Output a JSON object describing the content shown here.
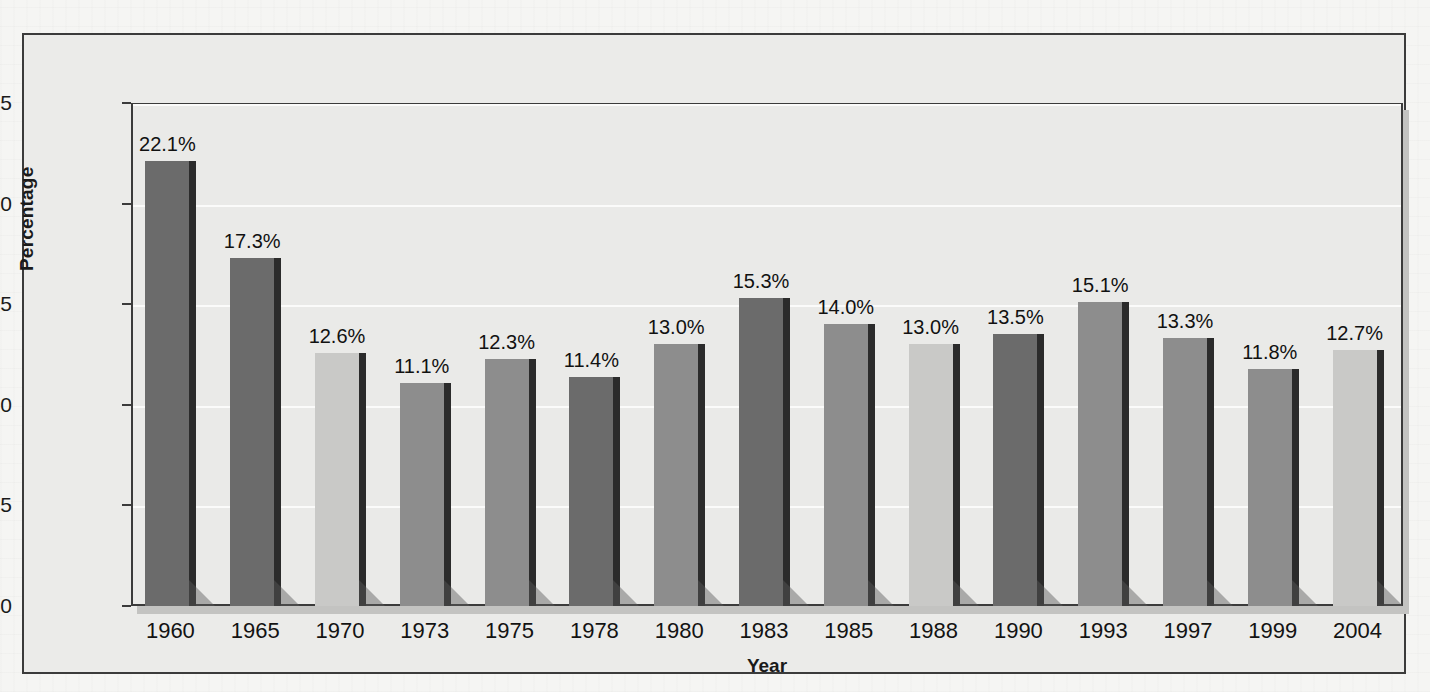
{
  "chart_data": {
    "type": "bar",
    "title": "",
    "xlabel": "Year",
    "ylabel": "Percentage",
    "categories": [
      "1960",
      "1965",
      "1970",
      "1973",
      "1975",
      "1978",
      "1980",
      "1983",
      "1985",
      "1988",
      "1990",
      "1993",
      "1997",
      "1999",
      "2004"
    ],
    "values": [
      22.1,
      17.3,
      12.6,
      11.1,
      12.3,
      11.4,
      13.0,
      15.3,
      14.0,
      13.0,
      13.5,
      15.1,
      13.3,
      11.8,
      12.7
    ],
    "data_labels": [
      "22.1%",
      "17.3%",
      "12.6%",
      "11.1%",
      "12.3%",
      "11.4%",
      "13.0%",
      "15.3%",
      "14.0%",
      "13.0%",
      "13.5%",
      "15.1%",
      "13.3%",
      "11.8%",
      "12.7%"
    ],
    "bar_shades": [
      "dark",
      "dark",
      "light",
      "medium",
      "medium",
      "dark",
      "medium",
      "dark",
      "medium",
      "light",
      "dark",
      "medium",
      "medium",
      "medium",
      "light"
    ],
    "ylim": [
      0,
      25
    ],
    "yticks": [
      0,
      5,
      10,
      15,
      20,
      25
    ],
    "ytick_labels": [
      "0",
      "5",
      "10",
      "15",
      "20",
      "25"
    ],
    "grid": true,
    "legend": "none"
  },
  "colors": {
    "bar_dark": "#6b6b6b",
    "bar_medium": "#8d8d8d",
    "bar_light": "#c9c9c7",
    "bar_edge": "#2b2b2b",
    "plot_background": "#eaeae8",
    "page_background": "#f5f5f3",
    "frame_border": "#3b3b3b",
    "gridline": "#fbfbfa",
    "text": "#1a1a1a"
  },
  "caption": {
    "text": ""
  }
}
